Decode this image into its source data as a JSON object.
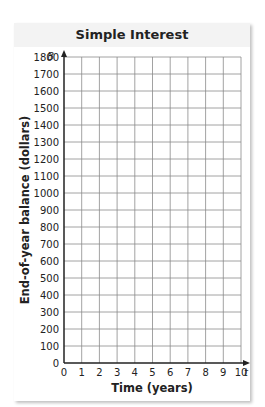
{
  "chart_data": {
    "type": "line",
    "title": "Simple Interest",
    "xlabel": "Time (years)",
    "ylabel": "End-of-year balance (dollars)",
    "x_axis_variable": "t",
    "y_axis_variable": "B",
    "x_ticks": [
      0,
      1,
      2,
      3,
      4,
      5,
      6,
      7,
      8,
      9,
      10
    ],
    "y_ticks": [
      0,
      100,
      200,
      300,
      400,
      500,
      600,
      700,
      800,
      900,
      1000,
      1100,
      1200,
      1300,
      1400,
      1500,
      1600,
      1700,
      1800
    ],
    "xlim": [
      0,
      10
    ],
    "ylim": [
      0,
      1800
    ],
    "grid": true,
    "series": [],
    "note": "Blank grid with no plotted data"
  },
  "labels": {
    "title": "Simple Interest",
    "xlabel": "Time (years)",
    "ylabel": "End-of-year balance (dollars)",
    "x_var": "t",
    "y_var": "B"
  },
  "colors": {
    "grid": "#8a8a8a",
    "axis": "#222222",
    "panel_bg": "#f3f3f3"
  }
}
